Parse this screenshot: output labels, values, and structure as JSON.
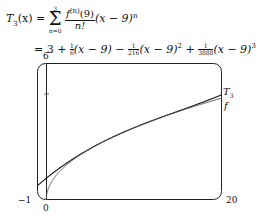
{
  "equation": {
    "lhs": "T",
    "lhs_sub": "3",
    "lhs_arg": "(x) =",
    "sum_top": "3",
    "sum_bottom": "n=0",
    "term_num": "f",
    "term_num_sup": "(n)",
    "term_num_arg": "(9)",
    "term_den": "n!",
    "term_tail": "(x − 9)",
    "term_tail_sup": "n",
    "line2_start": "= 3 +",
    "c1": {
      "num": "1",
      "den": "6"
    },
    "p1": "(x − 9) −",
    "c2": {
      "num": "1",
      "den": "216"
    },
    "p2": "(x − 9)",
    "p2_sup": "2",
    "op3": "+",
    "c3": {
      "num": "1",
      "den": "3888"
    },
    "p3": "(x − 9)",
    "p3_sup": "3"
  },
  "chart_data": {
    "type": "line",
    "title": "",
    "xlabel": "",
    "ylabel": "",
    "xlim": [
      -1,
      20
    ],
    "ylim": [
      0,
      6
    ],
    "tick_labels": {
      "x": [
        "-1",
        "0",
        "20"
      ],
      "y": [
        "6"
      ]
    },
    "grid": false,
    "series": [
      {
        "name": "T3",
        "label": "T₃",
        "expression": "3 + (x-9)/6 - (x-9)^2/216 + (x-9)^3/3888",
        "x": [
          -1,
          0,
          2,
          4,
          6,
          9,
          12,
          15,
          18,
          20
        ],
        "values": [
          0.613,
          0.917,
          1.497,
          2.016,
          2.466,
          3.0,
          3.466,
          3.889,
          4.312,
          4.615
        ]
      },
      {
        "name": "f",
        "label": "f",
        "expression": "sqrt(x)",
        "x": [
          0,
          0.25,
          1,
          2,
          4,
          6,
          9,
          12,
          15,
          18,
          20
        ],
        "values": [
          0,
          0.5,
          1.0,
          1.414,
          2.0,
          2.449,
          3.0,
          3.464,
          3.873,
          4.243,
          4.472
        ]
      }
    ],
    "legend": "inline labels at right end of curves"
  },
  "labels": {
    "y_top": "6",
    "x_left": "−1",
    "x_origin": "0",
    "x_right": "20",
    "t3": "T",
    "t3_sub": "3",
    "f": "f"
  }
}
